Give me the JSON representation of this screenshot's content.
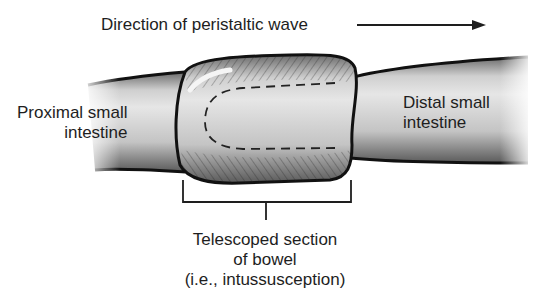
{
  "diagram": {
    "title": "Direction of peristaltic wave",
    "labels": {
      "proximal": [
        "Proximal small",
        "intestine"
      ],
      "distal": [
        "Distal small",
        "intestine"
      ],
      "telescoped": [
        "Telescoped section",
        "of bowel",
        "(i.e., intussusception)"
      ]
    },
    "colors": {
      "ink": "#1e1e1e",
      "tube_fill": "#c9c9c9",
      "highlight": "#efefef",
      "background": "#ffffff"
    }
  }
}
